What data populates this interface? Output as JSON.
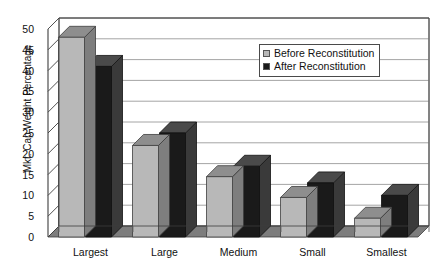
{
  "chart_data": {
    "type": "bar",
    "title": "",
    "subtitle": "",
    "xlabel": "",
    "ylabel": "Mkt. Cap Weight Percentage",
    "categories": [
      "Largest",
      "Large",
      "Medium",
      "Small",
      "Smallest"
    ],
    "series": [
      {
        "name": "Before Reconstitution",
        "values": [
          48,
          22,
          14.5,
          9.5,
          4.5
        ],
        "color": "#b8b8b8"
      },
      {
        "name": "After Reconstitution",
        "values": [
          41,
          25,
          17,
          13,
          10
        ],
        "color": "#1a1a1a"
      }
    ],
    "ylim": [
      0,
      50
    ],
    "yticks": [
      0,
      5,
      10,
      15,
      20,
      25,
      30,
      35,
      40,
      45,
      50
    ],
    "ytick_labels": [
      "0",
      "5",
      "10",
      "15",
      "20",
      "25",
      "30",
      "35",
      "40",
      "45",
      "50"
    ],
    "grid": true,
    "grid_axis": "y",
    "legend_position": "upper right",
    "style": "3d-column",
    "annotations": []
  },
  "legend": {
    "entries": [
      {
        "label": "Before Reconstitution",
        "swatch": "legend-swatch-before",
        "color": "#b8b8b8"
      },
      {
        "label": "After Reconstitution",
        "swatch": "legend-swatch-after",
        "color": "#1a1a1a"
      }
    ]
  },
  "colors": {
    "before_face": "#b8b8b8",
    "before_top": "#8e8e8e",
    "before_side": "#7e7e7e",
    "after_face": "#1a1a1a",
    "after_top": "#4a4a4a",
    "after_side": "#3a3a3a",
    "floor": "#7d7d7d",
    "axis": "#3d3d3d",
    "grid": "#9a9a9a",
    "background": "#ffffff"
  }
}
